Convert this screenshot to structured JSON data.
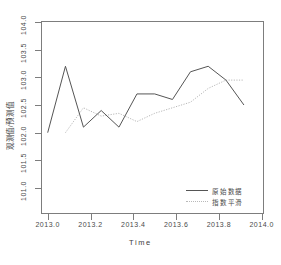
{
  "chart_data": {
    "type": "line",
    "title": "",
    "xlabel": "Time",
    "ylabel": "观测值/预测值",
    "xlim": [
      2013.0,
      2014.0
    ],
    "ylim": [
      101.0,
      104.0
    ],
    "grid": false,
    "legend_position": "bottom-right",
    "xticks": [
      "2013.0",
      "2013.2",
      "2013.4",
      "2013.6",
      "2013.8",
      "2014.0"
    ],
    "xtick_values": [
      2013.0,
      2013.2,
      2013.4,
      2013.6,
      2013.8,
      2014.0
    ],
    "yticks": [
      "101.0",
      "101.5",
      "102.0",
      "102.5",
      "103.0",
      "103.5",
      "104.0"
    ],
    "ytick_values": [
      101.0,
      101.5,
      102.0,
      102.5,
      103.0,
      103.5,
      104.0
    ],
    "x": [
      2013.0,
      2013.083,
      2013.167,
      2013.25,
      2013.333,
      2013.417,
      2013.5,
      2013.583,
      2013.667,
      2013.75,
      2013.833,
      2013.917
    ],
    "series": [
      {
        "name": "原始数据",
        "style": "solid",
        "color": "#555555",
        "values": [
          102.0,
          103.2,
          102.1,
          102.4,
          102.1,
          102.7,
          102.7,
          102.6,
          103.1,
          103.2,
          102.95,
          102.5
        ]
      },
      {
        "name": "指数平滑",
        "style": "dotted",
        "color": "#b9b9b9",
        "values": [
          null,
          102.0,
          102.45,
          102.3,
          102.35,
          102.2,
          102.35,
          102.45,
          102.55,
          102.8,
          102.95,
          102.95
        ]
      }
    ]
  },
  "legend": {
    "entries": [
      {
        "label": "原始数据",
        "style": "solid"
      },
      {
        "label": "指数平滑",
        "style": "dotted"
      }
    ]
  },
  "colors": {
    "observed": "#555555",
    "smoothed": "#b9b9b9",
    "axis": "#7d7d7d",
    "text": "#4a4a4a",
    "background": "#ffffff"
  }
}
